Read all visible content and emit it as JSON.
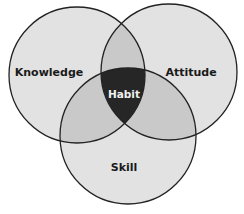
{
  "diagram": {
    "type": "venn",
    "sets": [
      {
        "name": "Knowledge"
      },
      {
        "name": "Attitude"
      },
      {
        "name": "Skill"
      }
    ],
    "intersection": {
      "name": "Habit"
    },
    "labels": {
      "knowledge": "Knowledge",
      "attitude": "Attitude",
      "skill": "Skill",
      "habit": "Habit"
    },
    "colors": {
      "circle_fill": "#e2e2e2",
      "overlap_fill": "#c9c9c9",
      "center_fill": "#262626",
      "stroke": "#222222"
    }
  }
}
